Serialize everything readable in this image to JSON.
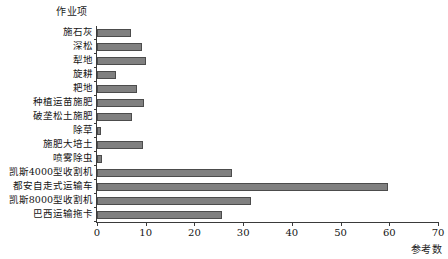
{
  "chart_data": {
    "type": "bar",
    "orientation": "horizontal",
    "title": "",
    "xlabel": "参考数",
    "ylabel": "作业项",
    "xlim": [
      0,
      70
    ],
    "xticks": [
      0,
      10,
      20,
      30,
      40,
      50,
      60,
      70
    ],
    "grid": false,
    "legend": null,
    "bar_color": "#808080",
    "bar_edge_color": "#4c4c4c",
    "axis_color": "#3a3a3a",
    "categories": [
      "施石灰",
      "深松",
      "犁地",
      "旋耕",
      "耙地",
      "种植运苗施肥",
      "破垄松土施肥",
      "除草",
      "施肥大培土",
      "喷雾除虫",
      "凯斯4000型收割机",
      "都安自走式运输车",
      "凯斯8000型收割机",
      "巴西运输拖卡"
    ],
    "values": [
      7,
      9.3,
      10,
      4,
      8.3,
      9.7,
      7.2,
      0.8,
      9.4,
      1,
      27.8,
      59.8,
      31.6,
      25.6
    ]
  }
}
